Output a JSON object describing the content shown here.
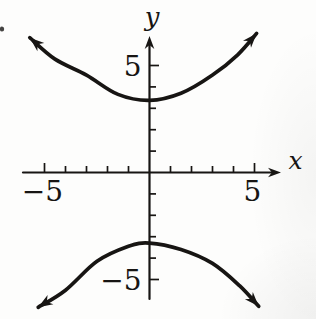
{
  "figure": {
    "background": "#fdfdfc",
    "ink_color": "#171513",
    "caption": ""
  },
  "chart_data": {
    "type": "line",
    "title": "",
    "xlabel": "x",
    "ylabel": "y",
    "xlim": [
      -6.1,
      6.1
    ],
    "ylim": [
      -7,
      7
    ],
    "grid": false,
    "legend": "none",
    "x_ticks": [
      -5,
      -4,
      -3,
      -2,
      -1,
      1,
      2,
      3,
      4,
      5
    ],
    "y_ticks": [
      1,
      2,
      3,
      4,
      5,
      -1,
      -2,
      -3,
      -4,
      -5
    ],
    "x_tick_labels": [
      {
        "value": -5,
        "text": "−5"
      },
      {
        "value": 5,
        "text": "5"
      }
    ],
    "y_tick_labels": [
      {
        "value": 5,
        "text": "5"
      },
      {
        "value": -5,
        "text": "−5"
      }
    ],
    "series": [
      {
        "name": "upper branch",
        "points": [
          [
            -5.7,
            6.3
          ],
          [
            -4.5,
            5.3
          ],
          [
            -3.0,
            4.55
          ],
          [
            -1.5,
            3.65
          ],
          [
            0,
            3.37
          ],
          [
            1.5,
            3.7
          ],
          [
            3.0,
            4.55
          ],
          [
            4.2,
            5.5
          ],
          [
            5.1,
            6.5
          ]
        ]
      },
      {
        "name": "lower branch",
        "points": [
          [
            -5.3,
            -6.3
          ],
          [
            -4.0,
            -5.5
          ],
          [
            -2.5,
            -4.15
          ],
          [
            -1.0,
            -3.45
          ],
          [
            0,
            -3.3
          ],
          [
            1.5,
            -3.6
          ],
          [
            3.0,
            -4.25
          ],
          [
            4.3,
            -5.3
          ],
          [
            5.2,
            -6.25
          ]
        ]
      }
    ]
  }
}
